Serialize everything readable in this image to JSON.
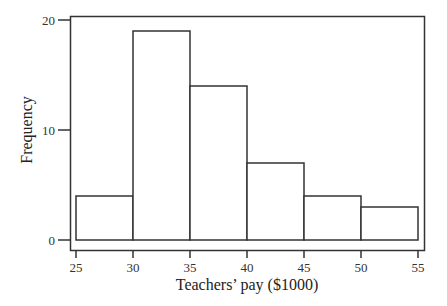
{
  "chart_data": {
    "type": "bar",
    "subtype": "histogram",
    "title": "",
    "xlabel": "Teachers’ pay ($1000)",
    "ylabel": "Frequency",
    "bins": [
      [
        25,
        30
      ],
      [
        30,
        35
      ],
      [
        35,
        40
      ],
      [
        40,
        45
      ],
      [
        45,
        50
      ],
      [
        50,
        55
      ]
    ],
    "categories": [
      "25-30",
      "30-35",
      "35-40",
      "40-45",
      "45-50",
      "50-55"
    ],
    "values": [
      4,
      19,
      14,
      7,
      4,
      3
    ],
    "xlim": [
      25,
      55
    ],
    "ylim": [
      0,
      20
    ],
    "x_ticks": [
      "25",
      "30",
      "35",
      "40",
      "45",
      "50",
      "55"
    ],
    "y_ticks": [
      "0",
      "10",
      "20"
    ],
    "grid": false,
    "legend": null,
    "colors": {
      "bar_fill": "#ffffff",
      "bar_edge": "#333333",
      "frame": "#333333"
    }
  }
}
